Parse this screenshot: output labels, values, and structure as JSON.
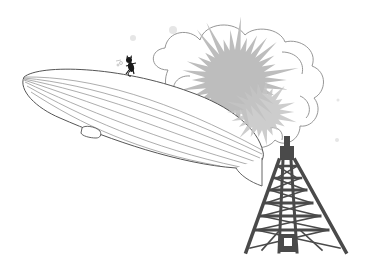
{
  "scene": {
    "description": "Line illustration of a zeppelin airship colliding with a lattice radio tower, with a large explosion cloud and a small black cat running on top of the airship",
    "elements": [
      {
        "name": "zeppelin",
        "label": "Zeppelin airship with gondola"
      },
      {
        "name": "explosion-cloud",
        "label": "Billowing outlined cloud"
      },
      {
        "name": "explosion-burst",
        "label": "Gray spiky starburst"
      },
      {
        "name": "radio-tower",
        "label": "Dark gray lattice tower"
      },
      {
        "name": "cat",
        "label": "Small black cat on top of airship"
      }
    ]
  },
  "colors": {
    "background": "#ffffff",
    "line": "#555555",
    "light_line": "#8a8a8a",
    "burst": "#bdbdbd",
    "tower": "#4a4a4a",
    "cat": "#1a1a1a"
  }
}
